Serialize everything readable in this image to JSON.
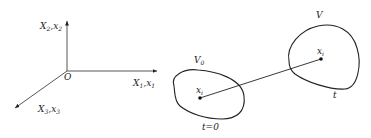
{
  "diagram": {
    "coordinate_system": {
      "origin_label": "O",
      "axes": [
        {
          "id": "axis-1",
          "label": "X",
          "label_sub": "1",
          "label2": "x",
          "label2_sub": "1"
        },
        {
          "id": "axis-2",
          "label": "X",
          "label_sub": "2",
          "label2": "x",
          "label2_sub": "2"
        },
        {
          "id": "axis-3",
          "label": "X",
          "label_sub": "3",
          "label2": "x",
          "label2_sub": "3"
        }
      ]
    },
    "initial_region": {
      "label": "V",
      "label_sub": "0",
      "point_label": "x",
      "point_sub": "i",
      "time_label": "t=0"
    },
    "current_region": {
      "label": "V",
      "point_label": "x",
      "point_sub": "i",
      "time_label": "t"
    },
    "colors": {
      "stroke": "#222222",
      "background": "#ffffff"
    }
  }
}
